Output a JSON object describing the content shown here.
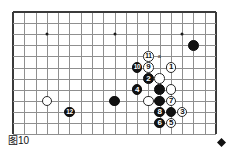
{
  "figure": {
    "caption": "图10",
    "corner_marker": "black-diamond"
  },
  "board": {
    "cols": 19,
    "rows": 12,
    "visible_cols": 19,
    "visible_rows": 12,
    "origin_x": 13,
    "origin_y": 12,
    "step_x": 11.28,
    "step_y": 11.1,
    "line_color": "#8f8f8f",
    "edge_color": "#3b3b3b",
    "background": "#ffffff",
    "star_points": [
      {
        "col": 3,
        "row": 2
      },
      {
        "col": 9,
        "row": 2
      },
      {
        "col": 15,
        "row": 2
      }
    ]
  },
  "colors": {
    "black_stone": "#111111",
    "white_stone": "#ffffff",
    "white_stone_border": "#2a2a2a",
    "black_label": "#ffffff",
    "white_label": "#111111"
  },
  "markers": [
    {
      "label": "a",
      "col": 13,
      "row": 4,
      "name": "point-a-marker"
    }
  ],
  "stones": [
    {
      "color": "black",
      "col": 16,
      "row": 3,
      "label": ""
    },
    {
      "color": "white",
      "col": 14,
      "row": 5,
      "label": "1"
    },
    {
      "color": "white",
      "col": 12,
      "row": 4,
      "label": "11"
    },
    {
      "color": "black",
      "col": 11,
      "row": 5,
      "label": "10"
    },
    {
      "color": "white",
      "col": 12,
      "row": 5,
      "label": "9"
    },
    {
      "color": "black",
      "col": 12,
      "row": 6,
      "label": "2"
    },
    {
      "color": "white",
      "col": 13,
      "row": 6,
      "label": ""
    },
    {
      "color": "black",
      "col": 11,
      "row": 7,
      "label": "4"
    },
    {
      "color": "black",
      "col": 13,
      "row": 7,
      "label": ""
    },
    {
      "color": "white",
      "col": 14,
      "row": 7,
      "label": ""
    },
    {
      "color": "black",
      "col": 13,
      "row": 8,
      "label": ""
    },
    {
      "color": "white",
      "col": 12,
      "row": 8,
      "label": ""
    },
    {
      "color": "white",
      "col": 14,
      "row": 8,
      "label": "7"
    },
    {
      "color": "black",
      "col": 13,
      "row": 9,
      "label": "8"
    },
    {
      "color": "black",
      "col": 14,
      "row": 9,
      "label": ""
    },
    {
      "color": "white",
      "col": 15,
      "row": 9,
      "label": "3"
    },
    {
      "color": "black",
      "col": 13,
      "row": 10,
      "label": "6"
    },
    {
      "color": "white",
      "col": 14,
      "row": 10,
      "label": "5"
    },
    {
      "color": "white",
      "col": 3,
      "row": 8,
      "label": ""
    },
    {
      "color": "black",
      "col": 5,
      "row": 9,
      "label": "12"
    },
    {
      "color": "black",
      "col": 9,
      "row": 8,
      "label": ""
    }
  ]
}
